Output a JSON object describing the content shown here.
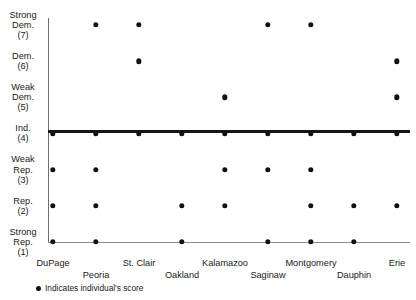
{
  "header": {
    "title_fragment": "PARTY IDENTIFICATION SCORES FOR COUNTY PARTY CHAIRS",
    "page_number": "103"
  },
  "legend": {
    "marker_label": "Indicates individual's score"
  },
  "chart_data": {
    "type": "scatter",
    "title": "PARTY IDENTIFICATION SCORES FOR COUNTY PARTY CHAIRS",
    "xlabel": "",
    "ylabel": "",
    "grid": false,
    "legend_position": "bottom-left",
    "categories": [
      "DuPage",
      "Peoria",
      "St. Clair",
      "Oakland",
      "Kalamazoo",
      "Saginaw",
      "Montgomery",
      "Dauphin",
      "Erie"
    ],
    "y_ticks": [
      {
        "value": 7,
        "label": "Strong\nDem.\n(7)",
        "lines": [
          "Strong",
          "Dem.",
          "(7)"
        ]
      },
      {
        "value": 6,
        "label": "Dem.\n(6)",
        "lines": [
          "Dem.",
          "(6)"
        ]
      },
      {
        "value": 5,
        "label": "Weak\nDem.\n(5)",
        "lines": [
          "Weak",
          "Dem.",
          "(5)"
        ]
      },
      {
        "value": 4,
        "label": "Ind.\n(4)",
        "lines": [
          "Ind.",
          "(4)"
        ]
      },
      {
        "value": 3,
        "label": "Weak\nRep.\n(3)",
        "lines": [
          "Weak",
          "Rep.",
          "(3)"
        ]
      },
      {
        "value": 2,
        "label": "Rep.\n(2)",
        "lines": [
          "Rep.",
          "(2)"
        ]
      },
      {
        "value": 1,
        "label": "Strong\nRep.\n(1)",
        "lines": [
          "Strong",
          "Rep.",
          "(1)"
        ]
      }
    ],
    "ylim": [
      1,
      7
    ],
    "reference_line": {
      "value": 4,
      "label": "Ind. (4)"
    },
    "points": [
      {
        "category": "DuPage",
        "values": [
          4,
          3,
          2,
          1
        ]
      },
      {
        "category": "Peoria",
        "values": [
          7,
          4,
          3,
          2,
          1
        ]
      },
      {
        "category": "St. Clair",
        "values": [
          7,
          6,
          4
        ]
      },
      {
        "category": "Oakland",
        "values": [
          4,
          2,
          1
        ]
      },
      {
        "category": "Kalamazoo",
        "values": [
          5,
          4,
          3,
          2
        ]
      },
      {
        "category": "Saginaw",
        "values": [
          7,
          4,
          3,
          1
        ]
      },
      {
        "category": "Montgomery",
        "values": [
          7,
          4,
          3,
          2,
          1
        ]
      },
      {
        "category": "Dauphin",
        "values": [
          4,
          2,
          1
        ]
      },
      {
        "category": "Erie",
        "values": [
          6,
          5,
          4,
          2
        ]
      }
    ]
  }
}
